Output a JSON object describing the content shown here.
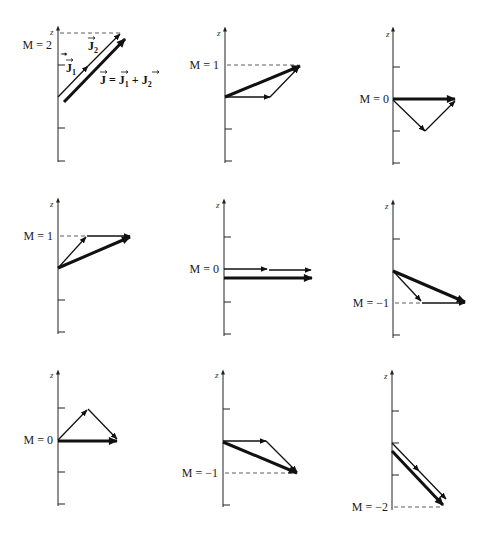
{
  "figure": {
    "axis_label": "z",
    "vector_labels": {
      "j1": "J⃗1",
      "j2": "J⃗2",
      "sum": "J⃗ = J⃗1 + J⃗2"
    },
    "panels": [
      {
        "id": 1,
        "m_label": "M = 2"
      },
      {
        "id": 2,
        "m_label": "M = 1"
      },
      {
        "id": 3,
        "m_label": "M = 0"
      },
      {
        "id": 4,
        "m_label": "M = 1"
      },
      {
        "id": 5,
        "m_label": "M = 0"
      },
      {
        "id": 6,
        "m_label": "M = −1"
      },
      {
        "id": 7,
        "m_label": "M = 0"
      },
      {
        "id": 8,
        "m_label": "M = −1"
      },
      {
        "id": 9,
        "m_label": "M = −2"
      }
    ]
  }
}
